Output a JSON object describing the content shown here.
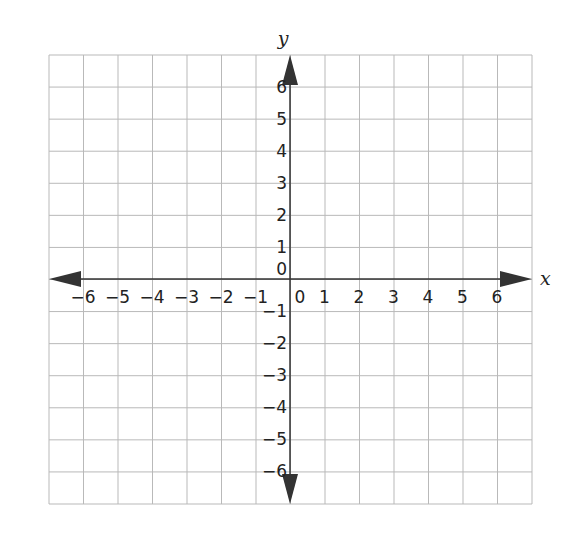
{
  "chart_data": {
    "type": "coordinate-plane",
    "xlabel": "x",
    "ylabel": "y",
    "xlim": [
      -7,
      7
    ],
    "ylim": [
      -7,
      7
    ],
    "x_ticks": [
      "−6",
      "−5",
      "−4",
      "−3",
      "−2",
      "−1",
      "0",
      "1",
      "2",
      "3",
      "4",
      "5",
      "6"
    ],
    "y_ticks": [
      "6",
      "5",
      "4",
      "3",
      "2",
      "1",
      "0",
      "−1",
      "−2",
      "−3",
      "−4",
      "−5",
      "−6"
    ],
    "grid": true,
    "arrows": [
      "left",
      "right",
      "up",
      "down"
    ]
  },
  "layout": {
    "origin_px": [
      290,
      279
    ],
    "x_step": 34.5,
    "y_step": 32.07,
    "grid_left": 49,
    "grid_right": 532,
    "grid_top": 55,
    "grid_bottom": 504,
    "cols": 14,
    "rows": 14
  },
  "colors": {
    "grid": "#b9b9b9",
    "axis": "#333333",
    "text": "#222222"
  }
}
